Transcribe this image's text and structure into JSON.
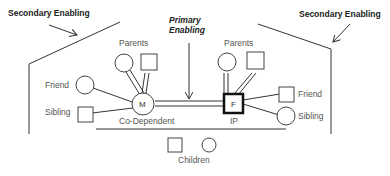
{
  "labels": {
    "secondary_left": "Secondary Enabling",
    "secondary_right": "Secondary Enabling",
    "primary_line1": "Primary",
    "primary_line2": "Enabling",
    "parents_left": "Parents",
    "parents_right": "Parents",
    "friend_left": "Friend",
    "sibling_left": "Sibling",
    "friend_right": "Friend",
    "sibling_right": "Sibling",
    "co_dependent": "Co-Dependent",
    "ip": "IP",
    "children": "Children"
  },
  "nodes": {
    "m": "M",
    "f": "F"
  },
  "colors": {
    "line": "#333333",
    "text": "#555555",
    "background": "#ffffff"
  }
}
